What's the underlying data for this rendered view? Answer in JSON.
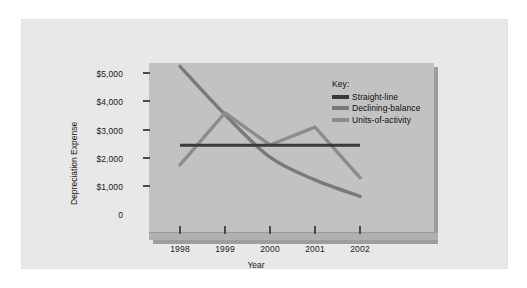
{
  "figure": {
    "background_color": "#e8e8e8",
    "plot_background_color": "#c2c2c2",
    "shadow_color": "#9d9d9d"
  },
  "legend": {
    "title": "Key:",
    "position": "inside-top-right",
    "entries": [
      {
        "label": "Straight-line",
        "color": "#3a3a3a"
      },
      {
        "label": "Declining-balance",
        "color": "#7a7a7a"
      },
      {
        "label": "Units-of-activity",
        "color": "#8c8c8c"
      }
    ]
  },
  "axes": {
    "y_title": "Depreciation Expense",
    "x_title": "Year",
    "y_ticks": [
      "$5,000",
      "$4,000",
      "$3,000",
      "$2,000",
      "$1,000",
      "0"
    ],
    "x_ticks": [
      "1998",
      "1999",
      "2000",
      "2001",
      "2002"
    ]
  },
  "chart_data": {
    "type": "line",
    "title": "",
    "subtitle": "",
    "xlabel": "Year",
    "ylabel": "Depreciation Expense",
    "categories": [
      "1998",
      "1999",
      "2000",
      "2001",
      "2002"
    ],
    "x": [
      1998,
      1999,
      2000,
      2001,
      2002
    ],
    "ylim": [
      0,
      5600
    ],
    "xlim": [
      1998,
      2002
    ],
    "ytick_values": [
      5000,
      4000,
      3000,
      2000,
      1000,
      0
    ],
    "ytick_labels": [
      "$5,000",
      "$4,000",
      "$3,000",
      "$2,000",
      "$1,000",
      "0"
    ],
    "grid": false,
    "legend_position": "inside-top-right",
    "legend_title": "Key:",
    "series": [
      {
        "name": "Straight-line",
        "color": "#3a3a3a",
        "values": [
          2420,
          2420,
          2420,
          2420,
          2420
        ]
      },
      {
        "name": "Declining-balance",
        "color": "#7a7a7a",
        "values": [
          5200,
          3500,
          2000,
          1200,
          620
        ]
      },
      {
        "name": "Units-of-activity",
        "color": "#8c8c8c",
        "values": [
          1730,
          3560,
          2430,
          3060,
          1280
        ]
      }
    ]
  }
}
